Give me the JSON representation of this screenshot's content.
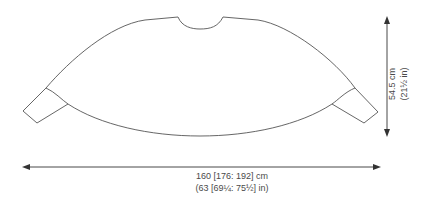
{
  "diagram": {
    "type": "knitting-schematic",
    "line_color": "#555555",
    "arrow_color": "#333333"
  },
  "dimensions": {
    "width": {
      "metric": "160 [176: 192] cm",
      "imperial": "(63 [69¼: 75½] in)"
    },
    "height": {
      "metric": "54.5 cm",
      "imperial": "(21½ in)"
    }
  }
}
